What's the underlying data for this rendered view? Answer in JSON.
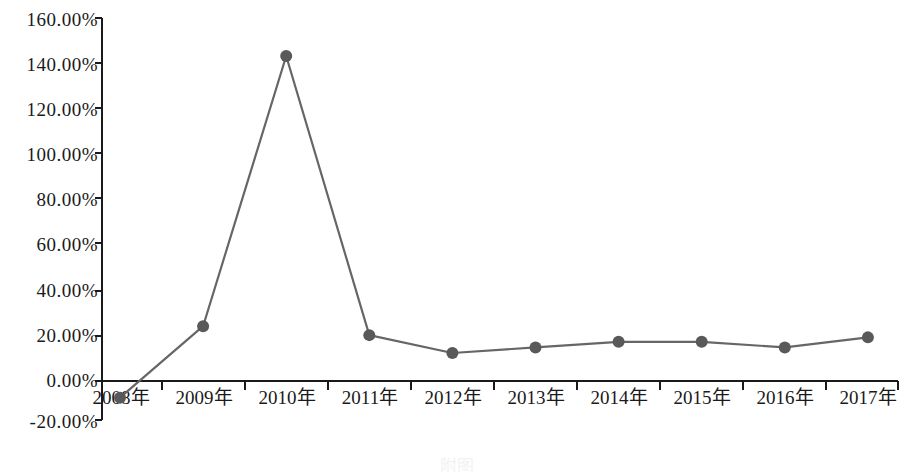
{
  "chart_data": {
    "type": "line",
    "title": "",
    "subtitle": "",
    "xlabel": "",
    "ylabel": "",
    "categories": [
      "2008年",
      "2009年",
      "2010年",
      "2011年",
      "2012年",
      "2013年",
      "2014年",
      "2015年",
      "2016年",
      "2017年"
    ],
    "values": [
      -10.0,
      22.0,
      143.0,
      18.0,
      10.0,
      12.5,
      15.0,
      15.0,
      12.5,
      17.0
    ],
    "series": [
      {
        "name": "",
        "values": [
          -10.0,
          22.0,
          143.0,
          18.0,
          10.0,
          12.5,
          15.0,
          15.0,
          12.5,
          17.0
        ]
      }
    ],
    "ylim": [
      -20,
      160
    ],
    "ytick_values": [
      160,
      140,
      120,
      100,
      80,
      60,
      40,
      20,
      0,
      -20
    ],
    "ytick_labels": [
      "160.00%",
      "140.00%",
      "120.00%",
      "100.00%",
      "80.00%",
      "60.00%",
      "40.00%",
      "20.00%",
      "0.00%",
      "-20.00%"
    ],
    "grid": false,
    "legend": "none",
    "line_color": "#666666",
    "marker_color": "#595959",
    "axis_color": "#1a1a1a",
    "background_color": "#ffffff",
    "marker_shape": "circle"
  },
  "caption": {
    "text": "附图"
  }
}
